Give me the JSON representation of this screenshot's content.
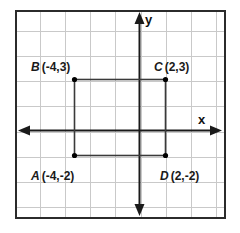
{
  "figure": {
    "width": 240,
    "height": 233,
    "background_color": "#ffffff",
    "border_color": "#2b2b2b",
    "grid_color": "#c9c9c9",
    "axis_color": "#1a1a1a",
    "point_color": "#000000",
    "shape_color": "#3a3a3a"
  },
  "axes": {
    "x_label": "x",
    "y_label": "y",
    "x_axis_name": "x-axis",
    "y_axis_name": "y-axis",
    "arrows": [
      "left",
      "right",
      "up",
      "down"
    ]
  },
  "chart_data": {
    "type": "scatter",
    "title": "",
    "xlabel": "x",
    "ylabel": "y",
    "grid": true,
    "legend": "none",
    "xlim": [
      -5,
      3
    ],
    "ylim": [
      -4,
      4
    ],
    "x_tick_step": 1,
    "y_tick_step": 1,
    "points": [
      {
        "name": "A",
        "label": "A (-4,-2)",
        "letter": "A",
        "coord_text": "(-4,-2)",
        "x": -4,
        "y": -2
      },
      {
        "name": "B",
        "label": "B (-4,3)",
        "letter": "B",
        "coord_text": "(-4,3)",
        "x": -4,
        "y": 3
      },
      {
        "name": "C",
        "label": "C (2,3)",
        "letter": "C",
        "coord_text": "(2,3)",
        "x": 2,
        "y": 3
      },
      {
        "name": "D",
        "label": "D (2,-2)",
        "letter": "D",
        "coord_text": "(2,-2)",
        "x": 2,
        "y": -2
      }
    ],
    "shapes": [
      {
        "type": "rectangle",
        "name": "rectangle-ABCD",
        "vertices": [
          "B",
          "C",
          "D",
          "A"
        ],
        "x_range": [
          -4,
          2
        ],
        "y_range": [
          -2,
          3
        ],
        "width": 6,
        "height": 5
      }
    ]
  },
  "labels": {
    "point_a": {
      "letter": "A",
      "coord": "(-4,-2)"
    },
    "point_b": {
      "letter": "B",
      "coord": "(-4,3)"
    },
    "point_c": {
      "letter": "C",
      "coord": "(2,3)"
    },
    "point_d": {
      "letter": "D",
      "coord": "(2,-2)"
    }
  }
}
